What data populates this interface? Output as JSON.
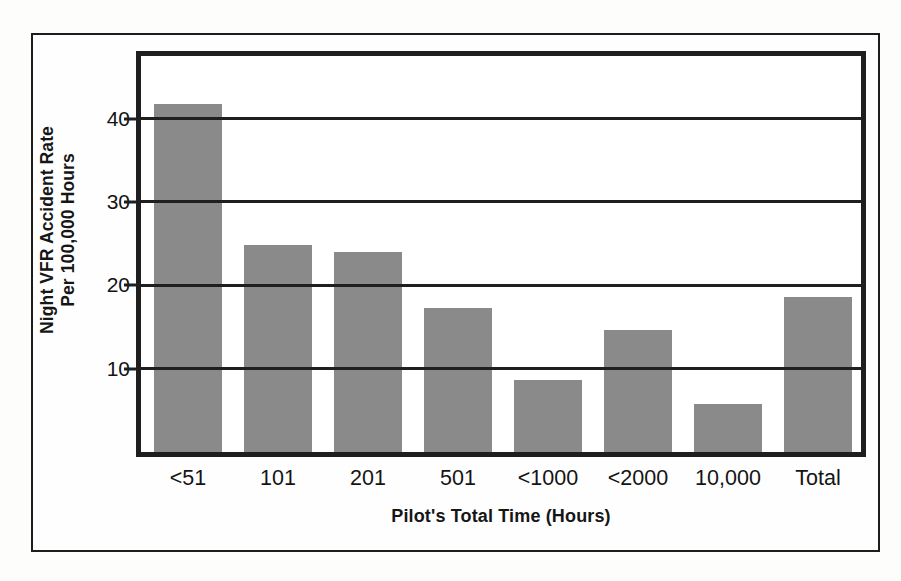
{
  "chart_data": {
    "type": "bar",
    "title": "",
    "xlabel": "Pilot's Total Time (Hours)",
    "ylabel": "Night VFR Accident Rate\nPer 100,000 Hours",
    "ylabel_lines": [
      "Night VFR Accident Rate",
      "Per 100,000 Hours"
    ],
    "categories": [
      "<51",
      "101",
      "201",
      "501",
      "<1000",
      "<2000",
      "10,000",
      "Total"
    ],
    "values": [
      41.8,
      24.8,
      24.0,
      17.3,
      8.6,
      14.6,
      5.8,
      18.6
    ],
    "ylim": [
      0,
      47.5
    ],
    "yticks": [
      10,
      20,
      30,
      40
    ],
    "ytick_labels": [
      "10",
      "20",
      "30",
      "40"
    ],
    "grid": true,
    "grid_axis": "y",
    "legend": false,
    "legend_position": "none",
    "bar_color": "#8a8a8a",
    "axis_color": "#1f1f1f",
    "background_color": "#ffffff",
    "page_background_color": "#fdfdfc"
  }
}
